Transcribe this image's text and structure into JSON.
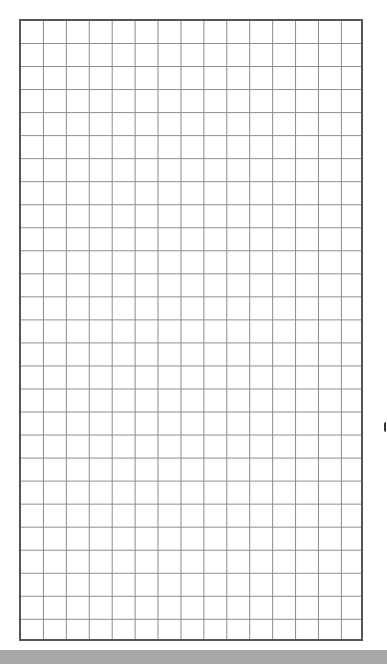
{
  "grid": {
    "columns": 15,
    "rows": 27,
    "line_color": "#8a8a8a",
    "border_color": "#555555"
  },
  "bottom_bar": {
    "color": "#a8a8a8"
  }
}
